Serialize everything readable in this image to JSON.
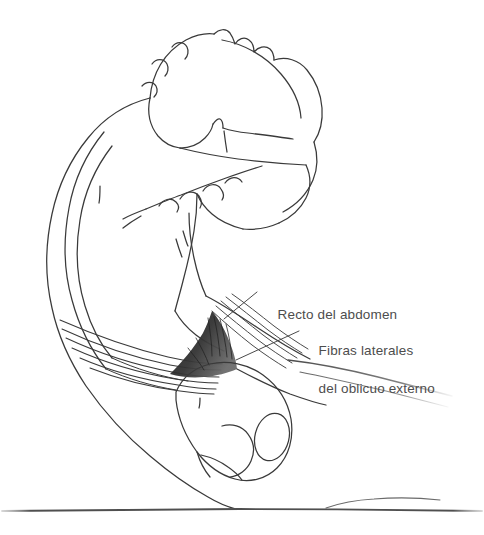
{
  "figure": {
    "title": "Recto del abdomen y fibras laterales del oblicuo externo",
    "alt": "Dibujo lineal de una persona realizando un encogimiento abdominal, de perfil, con las manos detras de la cabeza",
    "background_color": "#ffffff",
    "ink_color": "#3a3a3a",
    "shade_color": "#2b2b2b",
    "label_color": "#4d4d4d",
    "ground_line_color": "#5a5a5a"
  },
  "labels": {
    "recto": {
      "text": "Recto del abdomen",
      "leader_from": "248,296",
      "leader_to": "224,319"
    },
    "fibras": {
      "line1": "Fibras laterales",
      "line2": "del oblicuo externo",
      "leader_from": "296,332",
      "leader_to": "236,360"
    }
  },
  "annotations": {
    "ground_label": "linea del suelo"
  }
}
